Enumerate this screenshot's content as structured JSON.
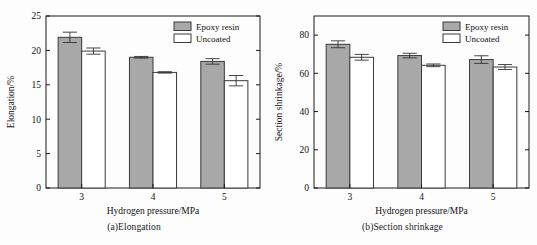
{
  "figure": {
    "background": "#fdfdfd",
    "bar_fill_coated": "#a8a8a8",
    "bar_fill_uncoated": "#ffffff",
    "bar_stroke": "#3a3a3a",
    "axis_color": "#1a1a1a"
  },
  "legend": {
    "coated_label": "Epoxy resin",
    "uncoated_label": "Uncoated"
  },
  "panel_a": {
    "caption": "(a)Elongation"
  },
  "panel_b": {
    "caption": "(b)Section shrinkage"
  },
  "chart_data": [
    {
      "type": "bar",
      "id": "elongation",
      "title": "(a)Elongation",
      "xlabel": "Hydrogen pressure/MPa",
      "ylabel": "Elongation/%",
      "categories": [
        "3",
        "4",
        "5"
      ],
      "xtick_labels": [
        "3",
        "4",
        "5"
      ],
      "ytick_labels": [
        "0",
        "5",
        "10",
        "15",
        "20",
        "25"
      ],
      "yticks": [
        0,
        5,
        10,
        15,
        20,
        25
      ],
      "ylim": [
        0,
        25
      ],
      "grid": false,
      "legend_position": "top-right",
      "series": [
        {
          "name": "Epoxy resin",
          "fill": "#a8a8a8",
          "values": [
            21.9,
            19.0,
            18.4
          ],
          "errors": [
            0.75,
            0.12,
            0.4
          ]
        },
        {
          "name": "Uncoated",
          "fill": "#ffffff",
          "values": [
            19.9,
            16.8,
            15.6
          ],
          "errors": [
            0.45,
            0.1,
            0.75
          ]
        }
      ]
    },
    {
      "type": "bar",
      "id": "section-shrinkage",
      "title": "(b)Section shrinkage",
      "xlabel": "Hydrogen pressure/MPa",
      "ylabel": "Section shrinkage/%",
      "categories": [
        "3",
        "4",
        "5"
      ],
      "xtick_labels": [
        "3",
        "4",
        "5"
      ],
      "ytick_labels": [
        "0",
        "20",
        "40",
        "60",
        "80"
      ],
      "yticks": [
        0,
        20,
        40,
        60,
        80
      ],
      "ylim": [
        0,
        90
      ],
      "grid": false,
      "legend_position": "top-right",
      "series": [
        {
          "name": "Epoxy resin",
          "fill": "#a8a8a8",
          "values": [
            75.2,
            69.3,
            67.2
          ],
          "errors": [
            1.8,
            1.2,
            2.0
          ]
        },
        {
          "name": "Uncoated",
          "fill": "#ffffff",
          "values": [
            68.4,
            64.2,
            63.3
          ],
          "errors": [
            1.5,
            0.7,
            1.3
          ]
        }
      ]
    }
  ]
}
